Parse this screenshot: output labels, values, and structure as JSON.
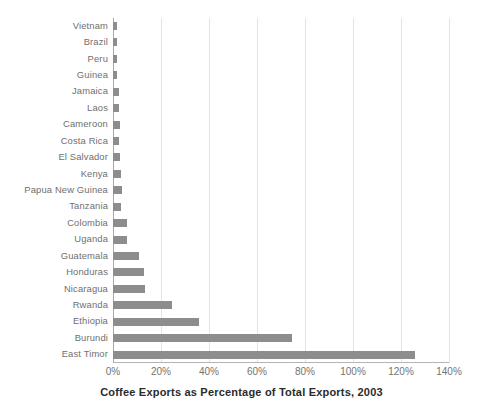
{
  "chart_data": {
    "type": "bar",
    "orientation": "horizontal",
    "title": "Coffee Exports as Percentage of Total Exports, 2003",
    "xlabel": "Coffee Exports as Percentage of Total Exports, 2003",
    "ylabel": "",
    "xlim": [
      0,
      140
    ],
    "xtick_labels": [
      "0%",
      "20%",
      "40%",
      "60%",
      "80%",
      "100%",
      "120%",
      "140%"
    ],
    "xticks": [
      0,
      20,
      40,
      60,
      80,
      100,
      120,
      140
    ],
    "grid": true,
    "legend": false,
    "bar_color": "#8d8d8d",
    "categories": [
      "Vietnam",
      "Brazil",
      "Peru",
      "Guinea",
      "Jamaica",
      "Laos",
      "Cameroon",
      "Costa Rica",
      "El Salvador",
      "Kenya",
      "Papua New Guinea",
      "Tanzania",
      "Colombia",
      "Uganda",
      "Guatemala",
      "Honduras",
      "Nicaragua",
      "Rwanda",
      "Ethiopia",
      "Burundi",
      "East Timor"
    ],
    "values": [
      1.5,
      1.5,
      1.6,
      1.7,
      2.6,
      2.5,
      2.8,
      2.7,
      2.9,
      3.5,
      3.6,
      3.4,
      5.8,
      5.8,
      11,
      13,
      13.5,
      24.5,
      36,
      74.5,
      126
    ]
  },
  "axis": {
    "title": "Coffee Exports as Percentage of Total Exports, 2003"
  }
}
